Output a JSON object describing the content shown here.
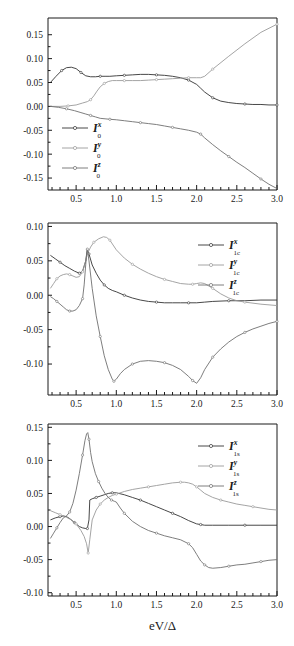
{
  "figure": {
    "background": "#ffffff",
    "xlabel": "eV/Δ",
    "width": 294,
    "height": 646
  },
  "colors": {
    "series_x": "#333333",
    "series_y": "#9a9a9a",
    "series_z": "#6f6f6f",
    "axis": "#1a1a1a"
  },
  "chart_data": [
    {
      "type": "line",
      "panel_index": 0,
      "title": "",
      "xlabel": "",
      "ylabel": "",
      "xlim": [
        0.15,
        3.0
      ],
      "ylim": [
        -0.175,
        0.185
      ],
      "xticks": [
        0.5,
        1.0,
        1.5,
        2.0,
        2.5,
        3.0
      ],
      "xticklabels": [
        "0.5",
        "1.0",
        "1.5",
        "2.0",
        "2.5",
        "3.0"
      ],
      "yticks": [
        -0.15,
        -0.1,
        -0.05,
        0.0,
        0.05,
        0.1,
        0.15
      ],
      "yticklabels": [
        "-0.15",
        "-0.10",
        "-0.05",
        "0.00",
        "0.05",
        "0.10",
        "0.15"
      ],
      "minor_xticks_per_interval": 5,
      "grid": false,
      "legend_position": "lower-left",
      "series": [
        {
          "name": "I_0^x",
          "base": "I",
          "superscript": "x",
          "subscript": "0",
          "color": "#333333",
          "x": [
            0.18,
            0.25,
            0.32,
            0.38,
            0.44,
            0.5,
            0.56,
            0.62,
            0.68,
            0.74,
            0.8,
            0.86,
            0.92,
            1.0,
            1.1,
            1.2,
            1.3,
            1.4,
            1.5,
            1.6,
            1.7,
            1.8,
            1.9,
            2.0,
            2.05,
            2.1,
            2.2,
            2.3,
            2.4,
            2.5,
            2.6,
            2.7,
            2.8,
            2.9,
            3.0
          ],
          "y": [
            0.05,
            0.063,
            0.075,
            0.081,
            0.082,
            0.079,
            0.071,
            0.064,
            0.062,
            0.062,
            0.063,
            0.063,
            0.063,
            0.064,
            0.065,
            0.066,
            0.067,
            0.067,
            0.066,
            0.065,
            0.063,
            0.06,
            0.055,
            0.046,
            0.038,
            0.03,
            0.018,
            0.011,
            0.008,
            0.006,
            0.005,
            0.004,
            0.004,
            0.003,
            0.003
          ]
        },
        {
          "name": "I_0^y",
          "base": "I",
          "superscript": "y",
          "subscript": "0",
          "color": "#9a9a9a",
          "x": [
            0.18,
            0.3,
            0.4,
            0.5,
            0.58,
            0.64,
            0.68,
            0.72,
            0.76,
            0.8,
            0.85,
            0.9,
            0.95,
            1.0,
            1.1,
            1.2,
            1.3,
            1.4,
            1.5,
            1.6,
            1.7,
            1.8,
            1.9,
            2.0,
            2.05,
            2.1,
            2.2,
            2.4,
            2.6,
            2.8,
            3.0
          ],
          "y": [
            0.0,
            0.0,
            0.001,
            0.003,
            0.007,
            0.01,
            0.014,
            0.022,
            0.032,
            0.041,
            0.048,
            0.052,
            0.054,
            0.054,
            0.054,
            0.054,
            0.054,
            0.055,
            0.056,
            0.057,
            0.058,
            0.059,
            0.06,
            0.06,
            0.06,
            0.063,
            0.078,
            0.105,
            0.131,
            0.155,
            0.172
          ]
        },
        {
          "name": "I_0^z",
          "base": "I",
          "superscript": "z",
          "subscript": "0",
          "color": "#6f6f6f",
          "x": [
            0.18,
            0.28,
            0.38,
            0.48,
            0.56,
            0.62,
            0.68,
            0.74,
            0.8,
            0.86,
            0.92,
            1.0,
            1.1,
            1.2,
            1.3,
            1.4,
            1.5,
            1.6,
            1.7,
            1.8,
            1.9,
            2.0,
            2.05,
            2.1,
            2.2,
            2.3,
            2.4,
            2.5,
            2.6,
            2.7,
            2.8,
            2.9,
            3.0
          ],
          "y": [
            0.0,
            -0.002,
            -0.005,
            -0.009,
            -0.013,
            -0.016,
            -0.019,
            -0.022,
            -0.025,
            -0.026,
            -0.027,
            -0.028,
            -0.03,
            -0.032,
            -0.034,
            -0.036,
            -0.038,
            -0.041,
            -0.044,
            -0.047,
            -0.05,
            -0.054,
            -0.058,
            -0.066,
            -0.08,
            -0.093,
            -0.105,
            -0.117,
            -0.128,
            -0.14,
            -0.152,
            -0.163,
            -0.172
          ]
        }
      ]
    },
    {
      "type": "line",
      "panel_index": 1,
      "title": "",
      "xlabel": "",
      "ylabel": "",
      "xlim": [
        0.15,
        3.0
      ],
      "ylim": [
        -0.145,
        0.105
      ],
      "xticks": [
        0.5,
        1.0,
        1.5,
        2.0,
        2.5,
        3.0
      ],
      "xticklabels": [
        "0.5",
        "1.0",
        "1.5",
        "2.0",
        "2.5",
        "3.0"
      ],
      "yticks": [
        -0.1,
        -0.05,
        0.0,
        0.05,
        0.1
      ],
      "yticklabels": [
        "-0.10",
        "-0.05",
        "0.00",
        "0.05",
        "0.10"
      ],
      "minor_xticks_per_interval": 5,
      "grid": false,
      "legend_position": "upper-right",
      "series": [
        {
          "name": "I_1c^x",
          "base": "I",
          "superscript": "x",
          "subscript": "1c",
          "color": "#333333",
          "x": [
            0.18,
            0.24,
            0.3,
            0.36,
            0.42,
            0.48,
            0.54,
            0.58,
            0.62,
            0.64,
            0.66,
            0.7,
            0.75,
            0.8,
            0.85,
            0.9,
            0.95,
            1.0,
            1.1,
            1.2,
            1.3,
            1.4,
            1.5,
            1.6,
            1.7,
            1.8,
            1.9,
            2.0,
            2.1,
            2.2,
            2.4,
            2.6,
            2.8,
            3.0
          ],
          "y": [
            0.058,
            0.053,
            0.048,
            0.043,
            0.039,
            0.035,
            0.032,
            0.035,
            0.05,
            0.067,
            0.06,
            0.044,
            0.032,
            0.022,
            0.015,
            0.01,
            0.007,
            0.005,
            0.0,
            -0.004,
            -0.007,
            -0.009,
            -0.01,
            -0.011,
            -0.011,
            -0.011,
            -0.011,
            -0.011,
            -0.01,
            -0.009,
            -0.008,
            -0.008,
            -0.007,
            -0.007
          ]
        },
        {
          "name": "I_1c^y",
          "base": "I",
          "superscript": "y",
          "subscript": "1c",
          "color": "#9a9a9a",
          "x": [
            0.18,
            0.22,
            0.26,
            0.3,
            0.34,
            0.38,
            0.42,
            0.46,
            0.5,
            0.54,
            0.58,
            0.62,
            0.64,
            0.68,
            0.72,
            0.78,
            0.84,
            0.88,
            0.92,
            0.96,
            1.0,
            1.1,
            1.2,
            1.3,
            1.4,
            1.5,
            1.6,
            1.7,
            1.8,
            1.9,
            1.95,
            2.0,
            2.05,
            2.1,
            2.2,
            2.3,
            2.4,
            2.5,
            2.6,
            2.8,
            3.0
          ],
          "y": [
            0.01,
            0.017,
            0.024,
            0.028,
            0.03,
            0.031,
            0.03,
            0.028,
            0.026,
            0.027,
            0.034,
            0.05,
            0.06,
            0.07,
            0.077,
            0.082,
            0.085,
            0.084,
            0.08,
            0.073,
            0.066,
            0.054,
            0.045,
            0.038,
            0.032,
            0.027,
            0.023,
            0.02,
            0.017,
            0.016,
            0.016,
            0.017,
            0.018,
            0.017,
            0.01,
            0.002,
            -0.004,
            -0.008,
            -0.01,
            -0.013,
            -0.015
          ]
        },
        {
          "name": "I_1c^z",
          "base": "I",
          "superscript": "z",
          "subscript": "1c",
          "color": "#6f6f6f",
          "x": [
            0.18,
            0.22,
            0.26,
            0.3,
            0.34,
            0.38,
            0.42,
            0.46,
            0.5,
            0.54,
            0.58,
            0.6,
            0.62,
            0.63,
            0.64,
            0.66,
            0.7,
            0.75,
            0.8,
            0.85,
            0.9,
            0.95,
            0.97,
            1.0,
            1.05,
            1.1,
            1.2,
            1.3,
            1.4,
            1.5,
            1.6,
            1.7,
            1.8,
            1.9,
            1.95,
            2.0,
            2.05,
            2.1,
            2.2,
            2.3,
            2.4,
            2.5,
            2.6,
            2.7,
            2.8,
            2.9,
            3.0
          ],
          "y": [
            -0.002,
            -0.005,
            -0.009,
            -0.013,
            -0.017,
            -0.021,
            -0.023,
            -0.023,
            -0.021,
            -0.015,
            -0.005,
            0.015,
            0.045,
            0.06,
            0.067,
            0.05,
            0.01,
            -0.03,
            -0.06,
            -0.088,
            -0.108,
            -0.122,
            -0.125,
            -0.122,
            -0.114,
            -0.108,
            -0.1,
            -0.096,
            -0.095,
            -0.096,
            -0.098,
            -0.102,
            -0.108,
            -0.118,
            -0.124,
            -0.128,
            -0.12,
            -0.108,
            -0.09,
            -0.078,
            -0.068,
            -0.06,
            -0.054,
            -0.049,
            -0.045,
            -0.041,
            -0.038
          ]
        }
      ]
    },
    {
      "type": "line",
      "panel_index": 2,
      "title": "",
      "xlabel": "eV/Δ",
      "ylabel": "",
      "xlim": [
        0.15,
        3.0
      ],
      "ylim": [
        -0.105,
        0.155
      ],
      "xticks": [
        0.5,
        1.0,
        1.5,
        2.0,
        2.5,
        3.0
      ],
      "xticklabels": [
        "0.5",
        "1.0",
        "1.5",
        "2.0",
        "2.5",
        "3.0"
      ],
      "yticks": [
        -0.1,
        -0.05,
        0.0,
        0.05,
        0.1,
        0.15
      ],
      "yticklabels": [
        "-0.10",
        "-0.05",
        "0.00",
        "0.05",
        "0.10",
        "0.15"
      ],
      "minor_xticks_per_interval": 5,
      "grid": false,
      "legend_position": "upper-right",
      "series": [
        {
          "name": "I_1s^x",
          "base": "I",
          "superscript": "x",
          "subscript": "1s",
          "color": "#333333",
          "x": [
            0.18,
            0.24,
            0.3,
            0.34,
            0.38,
            0.42,
            0.48,
            0.54,
            0.58,
            0.62,
            0.64,
            0.66,
            0.67,
            0.7,
            0.75,
            0.8,
            0.85,
            0.9,
            0.95,
            1.0,
            1.1,
            1.2,
            1.3,
            1.4,
            1.5,
            1.6,
            1.7,
            1.8,
            1.9,
            2.0,
            2.05,
            2.1,
            2.2,
            2.4,
            2.6,
            2.8,
            3.0
          ],
          "y": [
            0.01,
            0.013,
            0.015,
            0.016,
            0.015,
            0.012,
            0.006,
            0.0,
            -0.002,
            -0.003,
            -0.003,
            0.01,
            0.04,
            0.042,
            0.044,
            0.046,
            0.048,
            0.05,
            0.051,
            0.051,
            0.048,
            0.044,
            0.04,
            0.035,
            0.03,
            0.025,
            0.02,
            0.015,
            0.009,
            0.004,
            0.003,
            0.002,
            0.002,
            0.002,
            0.002,
            0.002,
            0.002
          ]
        },
        {
          "name": "I_1s^y",
          "base": "I",
          "superscript": "y",
          "subscript": "1s",
          "color": "#9a9a9a",
          "x": [
            0.18,
            0.24,
            0.3,
            0.34,
            0.38,
            0.44,
            0.5,
            0.56,
            0.6,
            0.63,
            0.65,
            0.67,
            0.7,
            0.75,
            0.8,
            0.85,
            0.9,
            0.95,
            1.0,
            1.1,
            1.2,
            1.3,
            1.4,
            1.5,
            1.6,
            1.7,
            1.8,
            1.85,
            1.9,
            1.95,
            2.0,
            2.05,
            2.1,
            2.2,
            2.3,
            2.4,
            2.5,
            2.6,
            2.7,
            2.8,
            2.9,
            3.0
          ],
          "y": [
            0.024,
            0.021,
            0.018,
            0.016,
            0.014,
            0.01,
            0.004,
            -0.006,
            -0.015,
            -0.026,
            -0.04,
            -0.02,
            0.01,
            0.025,
            0.034,
            0.04,
            0.044,
            0.047,
            0.049,
            0.053,
            0.056,
            0.058,
            0.06,
            0.062,
            0.064,
            0.066,
            0.067,
            0.067,
            0.066,
            0.064,
            0.06,
            0.055,
            0.05,
            0.044,
            0.04,
            0.037,
            0.034,
            0.032,
            0.03,
            0.028,
            0.026,
            0.025
          ]
        },
        {
          "name": "I_1s^z",
          "base": "I",
          "superscript": "z",
          "subscript": "1s",
          "color": "#6f6f6f",
          "x": [
            0.18,
            0.22,
            0.26,
            0.3,
            0.34,
            0.38,
            0.42,
            0.46,
            0.5,
            0.54,
            0.58,
            0.61,
            0.63,
            0.645,
            0.66,
            0.68,
            0.7,
            0.74,
            0.78,
            0.82,
            0.86,
            0.9,
            0.94,
            0.98,
            1.0,
            1.05,
            1.1,
            1.2,
            1.3,
            1.4,
            1.5,
            1.6,
            1.7,
            1.8,
            1.9,
            1.95,
            2.0,
            2.05,
            2.1,
            2.15,
            2.2,
            2.3,
            2.4,
            2.5,
            2.6,
            2.7,
            2.8,
            2.9,
            3.0
          ],
          "y": [
            -0.018,
            -0.01,
            -0.002,
            0.006,
            0.013,
            0.016,
            0.022,
            0.035,
            0.055,
            0.08,
            0.108,
            0.13,
            0.14,
            0.142,
            0.132,
            0.112,
            0.098,
            0.08,
            0.068,
            0.058,
            0.05,
            0.044,
            0.04,
            0.038,
            0.037,
            0.028,
            0.02,
            0.008,
            0.0,
            -0.006,
            -0.01,
            -0.014,
            -0.017,
            -0.02,
            -0.026,
            -0.032,
            -0.042,
            -0.052,
            -0.058,
            -0.062,
            -0.063,
            -0.062,
            -0.06,
            -0.058,
            -0.057,
            -0.055,
            -0.053,
            -0.051,
            -0.05
          ]
        }
      ]
    }
  ]
}
